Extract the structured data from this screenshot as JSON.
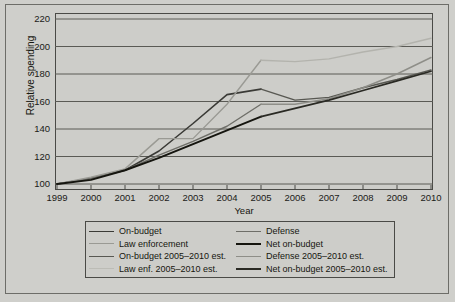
{
  "chart_data": {
    "type": "line",
    "title": "",
    "xlabel": "Year",
    "ylabel": "Relative spending",
    "xlim": [
      1999,
      2010
    ],
    "ylim": [
      100,
      220
    ],
    "ytick_labels": [
      "220",
      "200",
      "180",
      "160",
      "140",
      "120",
      "100"
    ],
    "ytick_values": [
      220,
      200,
      180,
      160,
      140,
      120,
      100
    ],
    "xtick_labels": [
      "1999",
      "2000",
      "2001",
      "2002",
      "2003",
      "2004",
      "2005",
      "2006",
      "2007",
      "2008",
      "2009",
      "2010"
    ],
    "xtick_values": [
      1999,
      2000,
      2001,
      2002,
      2003,
      2004,
      2005,
      2006,
      2007,
      2008,
      2009,
      2010
    ],
    "grid": "horizontal",
    "legend_position": "below",
    "series": [
      {
        "name": "On-budget",
        "color": "#3a3a36",
        "width": 1.6,
        "x": [
          1999,
          2000,
          2001,
          2002,
          2003,
          2004,
          2005
        ],
        "values": [
          100,
          104,
          110,
          124,
          144,
          165,
          169
        ]
      },
      {
        "name": "Defense",
        "color": "#6e6e68",
        "width": 1.4,
        "x": [
          1999,
          2000,
          2001,
          2002,
          2003,
          2004,
          2005
        ],
        "values": [
          100,
          104,
          110,
          121,
          131,
          142,
          158
        ]
      },
      {
        "name": "Law enforcement",
        "color": "#9a9a94",
        "width": 1.4,
        "x": [
          1999,
          2000,
          2001,
          2002,
          2003,
          2004,
          2005
        ],
        "values": [
          100,
          105,
          111,
          133,
          133,
          158,
          190
        ]
      },
      {
        "name": "Net on-budget",
        "color": "#15150f",
        "width": 2.0,
        "x": [
          1999,
          2000,
          2001,
          2002,
          2003,
          2004,
          2005
        ],
        "values": [
          100,
          103,
          110,
          119,
          129,
          139,
          149
        ]
      },
      {
        "name": "On-budget 2005–2010 est.",
        "color": "#585852",
        "width": 1.4,
        "x": [
          2005,
          2006,
          2007,
          2008,
          2009,
          2010
        ],
        "values": [
          169,
          161,
          163,
          170,
          176,
          183
        ]
      },
      {
        "name": "Defense 2005–2010 est.",
        "color": "#8e8e88",
        "width": 1.4,
        "x": [
          2005,
          2006,
          2007,
          2008,
          2009,
          2010
        ],
        "values": [
          158,
          158,
          162,
          170,
          180,
          192
        ]
      },
      {
        "name": "Law enf. 2005–2010 est.",
        "color": "#b3b3ad",
        "width": 1.4,
        "x": [
          2005,
          2006,
          2007,
          2008,
          2009,
          2010
        ],
        "values": [
          190,
          189,
          191,
          196,
          200,
          206
        ]
      },
      {
        "name": "Net on-budget 2005–2010 est.",
        "color": "#2a2a24",
        "width": 1.8,
        "x": [
          2005,
          2006,
          2007,
          2008,
          2009,
          2010
        ],
        "values": [
          149,
          155,
          161,
          168,
          175,
          182
        ]
      }
    ]
  },
  "legend": {
    "left_column": [
      {
        "label": "On-budget",
        "color": "#3a3a36",
        "width": 1.8
      },
      {
        "label": "Law enforcement",
        "color": "#9a9a94",
        "width": 1.4
      },
      {
        "label": "On-budget 2005–2010 est.",
        "color": "#585852",
        "width": 1.5
      },
      {
        "label": "Law enf. 2005–2010 est.",
        "color": "#bcbcb6",
        "width": 1.3
      }
    ],
    "right_column": [
      {
        "label": "Defense",
        "color": "#6e6e68",
        "width": 1.5
      },
      {
        "label": "Net on-budget",
        "color": "#15150f",
        "width": 2.2
      },
      {
        "label": "Defense 2005–2010 est.",
        "color": "#8e8e88",
        "width": 1.4
      },
      {
        "label": "Net on-budget 2005–2010 est.",
        "color": "#2a2a24",
        "width": 2.0
      }
    ]
  },
  "colors": {
    "page_background": "#cfcfcb",
    "plot_background": "#cdcdc9",
    "axis": "#4a4a46",
    "grid": "#5a5a55",
    "text": "#16160f"
  }
}
